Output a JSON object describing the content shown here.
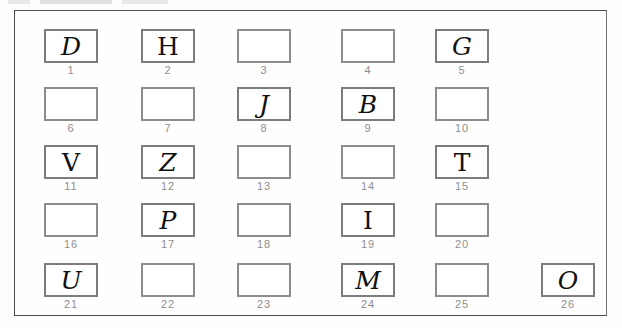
{
  "sheet": {
    "title": "Handwritten letter identification grid",
    "frame_color": "#4b4b4b",
    "box_border_color": "#8c8c8c",
    "number_color": "#8e8e8e",
    "glyph_color": "#101010",
    "background_color": "#fdfdfd"
  },
  "grid": {
    "rows": 5,
    "columns": 6,
    "total_cells": 26,
    "column_x": [
      43,
      140,
      236,
      340,
      434,
      540
    ],
    "row_y": [
      28,
      86,
      144,
      202,
      262
    ],
    "cells": [
      {
        "number": "1",
        "letter": "D",
        "row": 1,
        "col": 1,
        "filled": true
      },
      {
        "number": "2",
        "letter": "H",
        "row": 1,
        "col": 2,
        "filled": true
      },
      {
        "number": "3",
        "letter": "",
        "row": 1,
        "col": 3,
        "filled": false
      },
      {
        "number": "4",
        "letter": "",
        "row": 1,
        "col": 4,
        "filled": false
      },
      {
        "number": "5",
        "letter": "G",
        "row": 1,
        "col": 5,
        "filled": true
      },
      {
        "number": "6",
        "letter": "",
        "row": 2,
        "col": 1,
        "filled": false
      },
      {
        "number": "7",
        "letter": "",
        "row": 2,
        "col": 2,
        "filled": false
      },
      {
        "number": "8",
        "letter": "J",
        "row": 2,
        "col": 3,
        "filled": true
      },
      {
        "number": "9",
        "letter": "B",
        "row": 2,
        "col": 4,
        "filled": true
      },
      {
        "number": "10",
        "letter": "",
        "row": 2,
        "col": 5,
        "filled": false
      },
      {
        "number": "11",
        "letter": "V",
        "row": 3,
        "col": 1,
        "filled": true
      },
      {
        "number": "12",
        "letter": "Z",
        "row": 3,
        "col": 2,
        "filled": true
      },
      {
        "number": "13",
        "letter": "",
        "row": 3,
        "col": 3,
        "filled": false
      },
      {
        "number": "14",
        "letter": "",
        "row": 3,
        "col": 4,
        "filled": false
      },
      {
        "number": "15",
        "letter": "T",
        "row": 3,
        "col": 5,
        "filled": true
      },
      {
        "number": "16",
        "letter": "",
        "row": 4,
        "col": 1,
        "filled": false
      },
      {
        "number": "17",
        "letter": "P",
        "row": 4,
        "col": 2,
        "filled": true
      },
      {
        "number": "18",
        "letter": "",
        "row": 4,
        "col": 3,
        "filled": false
      },
      {
        "number": "19",
        "letter": "I",
        "row": 4,
        "col": 4,
        "filled": true
      },
      {
        "number": "20",
        "letter": "",
        "row": 4,
        "col": 5,
        "filled": false
      },
      {
        "number": "21",
        "letter": "U",
        "row": 5,
        "col": 1,
        "filled": true
      },
      {
        "number": "22",
        "letter": "",
        "row": 5,
        "col": 2,
        "filled": false
      },
      {
        "number": "23",
        "letter": "",
        "row": 5,
        "col": 3,
        "filled": false
      },
      {
        "number": "24",
        "letter": "M",
        "row": 5,
        "col": 4,
        "filled": true
      },
      {
        "number": "25",
        "letter": "",
        "row": 5,
        "col": 5,
        "filled": false
      },
      {
        "number": "26",
        "letter": "O",
        "row": 5,
        "col": 6,
        "filled": true
      }
    ]
  }
}
